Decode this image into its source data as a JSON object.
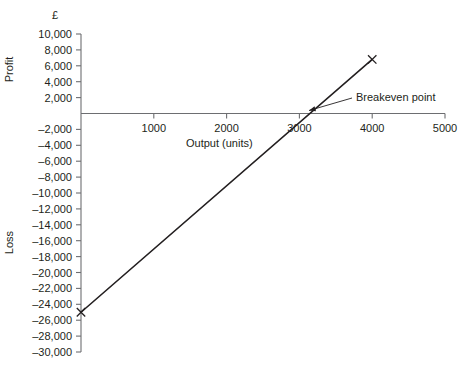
{
  "chart_data": {
    "type": "line",
    "title": "",
    "subtitle": "",
    "xlabel": "Output (units)",
    "ylabel_upper": "Profit",
    "ylabel_lower": "Loss",
    "currency_symbol": "£",
    "xlim": [
      0,
      5000
    ],
    "ylim": [
      -30000,
      10000
    ],
    "grid": false,
    "legend": "none",
    "x_ticks": [
      0,
      1000,
      2000,
      3000,
      4000,
      5000
    ],
    "x_tick_labels": [
      "",
      "1000",
      "2000",
      "3000",
      "4000",
      "5000"
    ],
    "y_ticks": [
      10000,
      8000,
      6000,
      4000,
      2000,
      0,
      -2000,
      -4000,
      -6000,
      -8000,
      -10000,
      -12000,
      -14000,
      -16000,
      -18000,
      -20000,
      -22000,
      -24000,
      -26000,
      -28000,
      -30000
    ],
    "y_tick_labels": [
      "10,000",
      "8,000",
      "6,000",
      "4,000",
      "2,000",
      "",
      "–2,000",
      "–4,000",
      "–6,000",
      "–8,000",
      "–10,000",
      "–12,000",
      "–14,000",
      "–16,000",
      "–18,000",
      "–20,000",
      "–22,000",
      "–24,000",
      "–26,000",
      "–28,000",
      "–30,000"
    ],
    "series": [
      {
        "name": "Profit/Loss",
        "points": [
          {
            "x": 0,
            "y": -25000,
            "marker": "x"
          },
          {
            "x": 4000,
            "y": 6800,
            "marker": "x"
          }
        ],
        "color": "#231f20"
      }
    ],
    "annotations": [
      {
        "label": "Breakeven point",
        "target_x": 3050,
        "target_y": 0,
        "text_x": 4200,
        "text_y": 2300
      }
    ],
    "zero_line": true,
    "line_color": "#231f20",
    "axis_color": "#6d6e71",
    "text_color": "#231f20"
  }
}
